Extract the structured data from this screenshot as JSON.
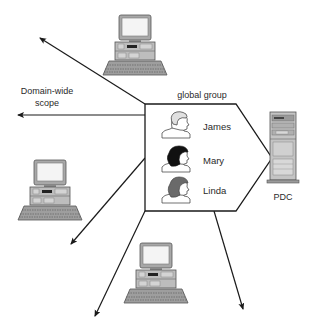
{
  "diagram": {
    "group_label": "global group",
    "scope_label_line1": "Domain-wide",
    "scope_label_line2": "scope",
    "server_label": "PDC",
    "members": [
      {
        "name": "James",
        "hair": "light"
      },
      {
        "name": "Mary",
        "hair": "black"
      },
      {
        "name": "Linda",
        "hair": "gray"
      }
    ],
    "workstations": [
      {
        "position": "top"
      },
      {
        "position": "left"
      },
      {
        "position": "bottom"
      }
    ],
    "arrows": [
      {
        "direction": "up-left"
      },
      {
        "direction": "left"
      },
      {
        "direction": "down-left"
      },
      {
        "direction": "down-left-bottom"
      },
      {
        "direction": "down-right"
      }
    ],
    "colors": {
      "line": "#1a1a1a",
      "hair_light": "#e0e0e0",
      "hair_black": "#111111",
      "hair_gray": "#6a6a6a",
      "device_fill": "#bdbdbd",
      "device_dark": "#7a7a7a",
      "screen": "#f4f4f4"
    }
  }
}
